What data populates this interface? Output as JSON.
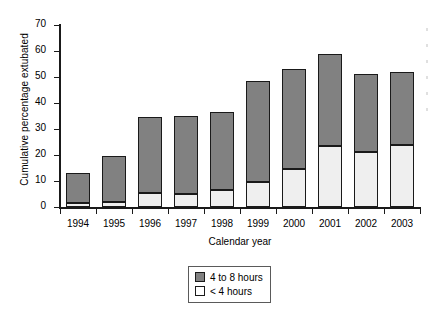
{
  "chart_data": {
    "type": "bar",
    "stacked": true,
    "title": "",
    "xlabel": "Calendar year",
    "ylabel": "Cumulative percentage extubated",
    "categories": [
      "1994",
      "1995",
      "1996",
      "1997",
      "1998",
      "1999",
      "2000",
      "2001",
      "2002",
      "2003"
    ],
    "series": [
      {
        "name": "< 4 hours",
        "color": "#efefef",
        "values": [
          1.5,
          2,
          5.5,
          5,
          6.5,
          9.5,
          14.5,
          23.5,
          21,
          24
        ]
      },
      {
        "name": "4 to 8 hours",
        "color": "#818181",
        "values": [
          11.5,
          17.5,
          29,
          30,
          30,
          39,
          38.5,
          35.5,
          30,
          28
        ]
      }
    ],
    "totals": [
      13,
      19.5,
      34.5,
      35,
      36.5,
      48.5,
      53,
      59,
      51,
      52
    ],
    "ylim": [
      0,
      70
    ],
    "yticks": [
      0,
      10,
      20,
      30,
      40,
      50,
      60,
      70
    ],
    "ytick_labels": [
      "0",
      "10",
      "20",
      "30",
      "40",
      "50",
      "60",
      "70"
    ],
    "grid": false,
    "legend_position": "bottom-center",
    "legend_entries": [
      {
        "label": "4 to 8 hours",
        "color": "#818181"
      },
      {
        "label": "< 4 hours",
        "color": "#ffffff"
      }
    ]
  },
  "axes": {
    "y_title": "Cumulative percentage extubated",
    "x_title": "Calendar year"
  },
  "legend": {
    "upper_label": "4 to 8 hours",
    "lower_label": "< 4 hours"
  },
  "colors": {
    "upper_segment": "#818181",
    "lower_segment": "#efefef",
    "axis": "#1a1a1a",
    "background": "#ffffff"
  }
}
